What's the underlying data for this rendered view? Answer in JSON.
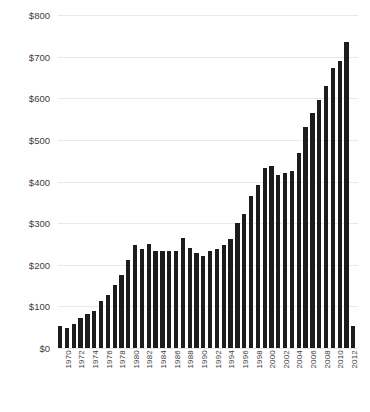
{
  "chart_data": {
    "type": "bar",
    "title": "",
    "subtitle": "",
    "xlabel": "",
    "ylabel": "",
    "ylim": [
      0,
      800
    ],
    "ytick_step": 100,
    "grid": true,
    "legend": null,
    "bar_color": "#1c1c1c",
    "grid_color": "#e9e9e9",
    "text_color": "#3d3d3d",
    "background": "#ffffff",
    "ytick_labels": [
      "$800",
      "$700",
      "$600",
      "$500",
      "$400",
      "$300",
      "$200",
      "$100",
      "$0"
    ],
    "ytick_values": [
      800,
      700,
      600,
      500,
      400,
      300,
      200,
      100,
      0
    ],
    "xtick_labels": [
      "1970",
      "1972",
      "1974",
      "1976",
      "1978",
      "1980",
      "1982",
      "1984",
      "1986",
      "1988",
      "1990",
      "1992",
      "1994",
      "1996",
      "1998",
      "2000",
      "2002",
      "2004",
      "2006",
      "2008",
      "2010",
      "2012"
    ],
    "xtick_interval": 2,
    "categories": [
      "1970",
      "1971",
      "1972",
      "1973",
      "1974",
      "1975",
      "1976",
      "1977",
      "1978",
      "1979",
      "1980",
      "1981",
      "1982",
      "1983",
      "1984",
      "1985",
      "1986",
      "1987",
      "1988",
      "1989",
      "1990",
      "1991",
      "1992",
      "1993",
      "1994",
      "1995",
      "1996",
      "1997",
      "1998",
      "1999",
      "2000",
      "2001",
      "2002",
      "2003",
      "2004",
      "2005",
      "2006",
      "2007",
      "2008",
      "2009",
      "2010",
      "2011",
      "2012",
      "2013"
    ],
    "values": [
      52,
      48,
      57,
      72,
      82,
      88,
      113,
      128,
      152,
      175,
      212,
      248,
      238,
      250,
      232,
      232,
      232,
      232,
      265,
      240,
      228,
      222,
      232,
      238,
      248,
      262,
      300,
      322,
      365,
      392,
      432,
      438,
      415,
      420,
      425,
      468,
      530,
      565,
      595,
      630,
      672,
      690,
      735,
      52
    ]
  }
}
